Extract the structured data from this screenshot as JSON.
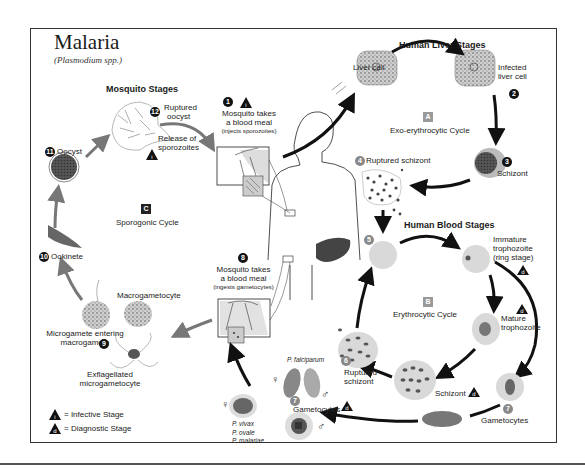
{
  "title": "Malaria",
  "subtitle": "(Plasmodium spp.)",
  "sections": {
    "mosquito": "Mosquito Stages",
    "liver": "Human Liver Stages",
    "blood": "Human Blood Stages"
  },
  "cycles": {
    "A": {
      "badge": "A",
      "label": "Exo-erythrocytic Cycle"
    },
    "B": {
      "badge": "B",
      "label": "Erythrocytic Cycle"
    },
    "C": {
      "badge": "C",
      "label": "Sporogonic Cycle"
    }
  },
  "stages": {
    "s1": {
      "num": "1",
      "line1": "Mosquito takes",
      "line2": "a blood meal",
      "line3": "(injects sporozoites)"
    },
    "s2": {
      "num": "2",
      "line1": "Infected",
      "line2": "liver cell"
    },
    "liver_cell": "Liver cell",
    "s3": {
      "num": "3",
      "label": "Schizont"
    },
    "s4": {
      "num": "4",
      "label": "Ruptured schizont"
    },
    "s5": {
      "num": "5"
    },
    "immature": {
      "line1": "Immature",
      "line2": "trophozoite",
      "line3": "(ring stage)"
    },
    "mature": {
      "line1": "Mature",
      "line2": "trophozoite"
    },
    "schizont_blood": "Schizont",
    "s6": {
      "num": "6",
      "line1": "Ruptured",
      "line2": "schizont"
    },
    "s7_right": {
      "num": "7",
      "label": "Gametocytes"
    },
    "s7_left": {
      "num": "7",
      "label": "Gametocytes"
    },
    "s8": {
      "num": "8",
      "line1": "Mosquito takes",
      "line2": "a blood meal",
      "line3": "(ingests gametocytes)"
    },
    "s9": {
      "num": "9",
      "line1": "Microgamete entering",
      "line2": "macrogamete"
    },
    "macro": "Macrogametocyte",
    "exflag": {
      "line1": "Exflagellated",
      "line2": "microgametocyte"
    },
    "s10": {
      "num": "10",
      "label": "Ookinete"
    },
    "s11": {
      "num": "11",
      "label": "Oocyst"
    },
    "s12": {
      "num": "12",
      "line1": "Ruptured",
      "line2": "oocyst",
      "line3": "Release of",
      "line4": "sporozoites"
    }
  },
  "species": {
    "falciparum": "P. falciparum",
    "others": [
      "P. vivax",
      "P. ovale",
      "P. malariae"
    ]
  },
  "symbols": {
    "female": "♀",
    "male": "♂"
  },
  "legend": {
    "infective": {
      "glyph": "i",
      "label": "= Infective Stage"
    },
    "diagnostic": {
      "glyph": "d",
      "label": "= Diagnostic Stage"
    }
  },
  "colors": {
    "cell": "#d9d9d9",
    "cell_dark": "#666666",
    "arrow": "#111111",
    "mosquito_arrow": "#777777",
    "liver_organ": "#444444",
    "frame": "#333333"
  }
}
